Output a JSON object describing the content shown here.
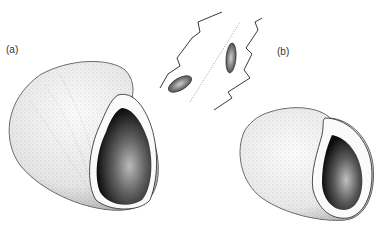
{
  "figure": {
    "labels": {
      "a": "(a)",
      "b": "(b)"
    },
    "colors": {
      "background": "#ffffff",
      "ink": "#1a1a1a",
      "stipple": "#555555",
      "aperture_dark": "#0d0d0d"
    }
  }
}
